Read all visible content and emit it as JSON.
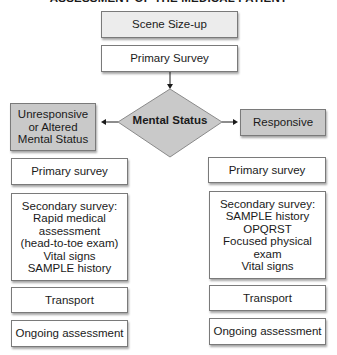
{
  "title": "ASSESSMENT OF THE MEDICAL PATIENT",
  "colors": {
    "box_border": "#7a7a7a",
    "light_fill": "#ececec",
    "gray_fill": "#c9c9c9",
    "white_fill": "#ffffff"
  },
  "top": {
    "scene_sizeup": "Scene Size-up",
    "primary_survey": "Primary Survey"
  },
  "decision": {
    "label": "Mental Status"
  },
  "left": {
    "header": "Unresponsive\nor Altered\nMental Status",
    "primary_survey": "Primary survey",
    "secondary_survey": "Secondary survey:\nRapid medical\nassessment\n(head-to-toe exam)\nVital signs\nSAMPLE history",
    "transport": "Transport",
    "ongoing": "Ongoing assessment"
  },
  "right": {
    "header": "Responsive",
    "primary_survey": "Primary survey",
    "secondary_survey": "Secondary survey:\nSAMPLE history\nOPQRST\nFocused physical\nexam\nVital signs",
    "transport": "Transport",
    "ongoing": "Ongoing assessment"
  }
}
